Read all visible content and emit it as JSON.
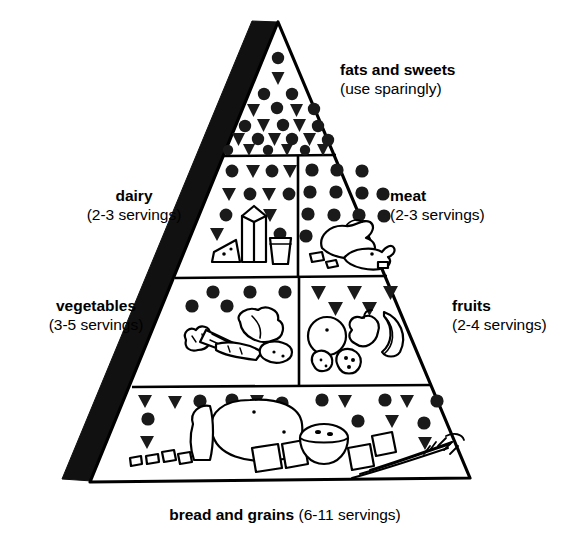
{
  "diagram": {
    "type": "food-pyramid",
    "background_color": "#ffffff",
    "ink_color": "#000000",
    "side_face_color": "#111111"
  },
  "tiers": [
    {
      "id": "fats",
      "name": "fats and sweets",
      "servings_text": "(use sparingly)",
      "label_position": "right",
      "symbols": [
        "circle",
        "triangle"
      ],
      "food_icons": []
    },
    {
      "id": "dairy",
      "name": "dairy",
      "servings_text": "(2-3 servings)",
      "label_position": "left",
      "symbols": [
        "circle",
        "triangle"
      ],
      "food_icons": [
        "milk-carton",
        "cheese-wedge",
        "drinking-glass"
      ]
    },
    {
      "id": "meat",
      "name": "meat",
      "servings_text": "(2-3 servings)",
      "label_position": "right",
      "symbols": [
        "circle"
      ],
      "food_icons": [
        "poultry",
        "fish",
        "meat-cuts"
      ]
    },
    {
      "id": "vegetables",
      "name": "vegetables",
      "servings_text": "(3-5 servings)",
      "label_position": "left",
      "symbols": [
        "circle"
      ],
      "food_icons": [
        "broccoli",
        "corn",
        "lettuce",
        "carrot",
        "potato"
      ]
    },
    {
      "id": "fruits",
      "name": "fruits",
      "servings_text": "(2-4 servings)",
      "label_position": "right",
      "symbols": [
        "triangle"
      ],
      "food_icons": [
        "orange",
        "apple",
        "banana",
        "strawberry",
        "raspberry"
      ]
    },
    {
      "id": "bread",
      "name": "bread and grains",
      "servings_text": "(6-11 servings)",
      "label_position": "bottom",
      "symbols": [
        "circle",
        "triangle"
      ],
      "food_icons": [
        "bread-loaf",
        "bread-slice",
        "rice-bowl",
        "pasta-squares",
        "wheat-stalks",
        "cereal-flakes"
      ]
    }
  ],
  "legend": {
    "circle_meaning": "fat (naturally occurring and added)",
    "triangle_meaning": "sugars (added)"
  }
}
